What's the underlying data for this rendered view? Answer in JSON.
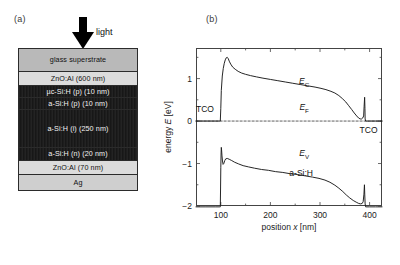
{
  "figure": {
    "panel_a_letter": "(a)",
    "panel_b_letter": "(b)"
  },
  "stack": {
    "light_label": "light",
    "layers": [
      {
        "label": "glass superstrate",
        "tone": "glass"
      },
      {
        "label": "ZnO:Al (600 nm)",
        "tone": "tco"
      },
      {
        "label": "µc-Si:H (p) (10 nm)",
        "tone": "dark"
      },
      {
        "label": "a-Si:H (p) (10 nm)",
        "tone": "dark"
      },
      {
        "label": "a-Si:H (i) (250 nm)",
        "tone": "dark"
      },
      {
        "label": "a-Si:H (n) (20 nm)",
        "tone": "dark"
      },
      {
        "label": "ZnO:Al (70 nm)",
        "tone": "tco"
      },
      {
        "label": "Ag",
        "tone": "ag"
      }
    ]
  },
  "chart_data": {
    "type": "line",
    "title": "",
    "xlabel": "position x [nm]",
    "ylabel": "energy E [eV]",
    "xlim": [
      50,
      425
    ],
    "ylim": [
      -2,
      1.72
    ],
    "xticks": [
      100,
      200,
      300,
      400
    ],
    "xtick_labels": [
      "100",
      "200",
      "300",
      "400"
    ],
    "yticks": [
      1,
      0,
      -1,
      -2
    ],
    "ytick_labels": [
      "1",
      "0",
      "−1",
      "−2"
    ],
    "xminor": [
      150,
      250,
      350
    ],
    "yminor": [
      1.5,
      0.5,
      -0.5,
      -1.5
    ],
    "grid": false,
    "legend": "none",
    "annotations": [
      {
        "text": "TCO",
        "x": 68,
        "y": 0.28,
        "name": "tco-left-label"
      },
      {
        "text": "TCO",
        "x": 398,
        "y": -0.22,
        "name": "tco-right-label"
      },
      {
        "text": "E_C",
        "x": 268,
        "y": 0.92,
        "name": "conduction-band-label"
      },
      {
        "text": "E_F",
        "x": 268,
        "y": 0.3,
        "name": "fermi-level-label"
      },
      {
        "text": "E_V",
        "x": 268,
        "y": -0.78,
        "name": "valence-band-label"
      },
      {
        "text": "a-Si:H",
        "x": 262,
        "y": -1.22,
        "name": "absorber-label"
      }
    ],
    "series": [
      {
        "name": "E_C",
        "label": "conduction band edge",
        "style": "solid",
        "points": [
          [
            50,
            0.0
          ],
          [
            70,
            0.0
          ],
          [
            88,
            0.0
          ],
          [
            96,
            0.0
          ],
          [
            99,
            0.0
          ],
          [
            100,
            0.3
          ],
          [
            101,
            0.72
          ],
          [
            103,
            1.06
          ],
          [
            105,
            1.24
          ],
          [
            107,
            1.36
          ],
          [
            109,
            1.44
          ],
          [
            111,
            1.49
          ],
          [
            113,
            1.5
          ],
          [
            115,
            1.47
          ],
          [
            117,
            1.41
          ],
          [
            120,
            1.34
          ],
          [
            124,
            1.27
          ],
          [
            129,
            1.22
          ],
          [
            135,
            1.17
          ],
          [
            142,
            1.13
          ],
          [
            150,
            1.1
          ],
          [
            160,
            1.07
          ],
          [
            172,
            1.04
          ],
          [
            185,
            1.01
          ],
          [
            200,
            0.98
          ],
          [
            215,
            0.95
          ],
          [
            230,
            0.92
          ],
          [
            245,
            0.89
          ],
          [
            260,
            0.86
          ],
          [
            275,
            0.83
          ],
          [
            290,
            0.8
          ],
          [
            302,
            0.77
          ],
          [
            312,
            0.74
          ],
          [
            322,
            0.7
          ],
          [
            330,
            0.66
          ],
          [
            338,
            0.6
          ],
          [
            345,
            0.53
          ],
          [
            352,
            0.45
          ],
          [
            358,
            0.36
          ],
          [
            364,
            0.27
          ],
          [
            369,
            0.19
          ],
          [
            374,
            0.12
          ],
          [
            378,
            0.07
          ],
          [
            381,
            0.05
          ],
          [
            384,
            0.05
          ],
          [
            386,
            0.07
          ],
          [
            388,
            0.12
          ],
          [
            389,
            0.35
          ],
          [
            390,
            0.56
          ],
          [
            390.6,
            0.3
          ],
          [
            391,
            0.05
          ],
          [
            392,
            0.0
          ],
          [
            400,
            0.0
          ],
          [
            412,
            0.0
          ],
          [
            425,
            0.0
          ]
        ]
      },
      {
        "name": "E_V",
        "label": "valence band edge",
        "style": "solid",
        "points": [
          [
            50,
            -2.02
          ],
          [
            70,
            -2.02
          ],
          [
            90,
            -2.02
          ],
          [
            98,
            -2.02
          ],
          [
            99,
            -2.02
          ],
          [
            99.5,
            -1.6
          ],
          [
            100,
            -1.1
          ],
          [
            100.6,
            -0.75
          ],
          [
            101,
            -0.62
          ],
          [
            101.6,
            -0.68
          ],
          [
            102.4,
            -0.82
          ],
          [
            103.4,
            -0.94
          ],
          [
            104.6,
            -1.02
          ],
          [
            106,
            -1.0
          ],
          [
            108,
            -0.93
          ],
          [
            110,
            -0.89
          ],
          [
            113,
            -0.88
          ],
          [
            117,
            -0.9
          ],
          [
            122,
            -0.93
          ],
          [
            128,
            -0.97
          ],
          [
            136,
            -1.01
          ],
          [
            145,
            -1.05
          ],
          [
            156,
            -1.08
          ],
          [
            168,
            -1.11
          ],
          [
            182,
            -1.14
          ],
          [
            196,
            -1.16
          ],
          [
            210,
            -1.19
          ],
          [
            225,
            -1.21
          ],
          [
            240,
            -1.24
          ],
          [
            255,
            -1.26
          ],
          [
            270,
            -1.29
          ],
          [
            285,
            -1.32
          ],
          [
            298,
            -1.35
          ],
          [
            310,
            -1.39
          ],
          [
            320,
            -1.44
          ],
          [
            330,
            -1.51
          ],
          [
            338,
            -1.58
          ],
          [
            346,
            -1.66
          ],
          [
            353,
            -1.74
          ],
          [
            360,
            -1.81
          ],
          [
            367,
            -1.87
          ],
          [
            373,
            -1.91
          ],
          [
            378,
            -1.94
          ],
          [
            382,
            -1.95
          ],
          [
            385,
            -1.94
          ],
          [
            387,
            -1.9
          ],
          [
            388.6,
            -1.72
          ],
          [
            389.6,
            -1.5
          ],
          [
            390.2,
            -1.72
          ],
          [
            391,
            -1.95
          ],
          [
            392,
            -2.02
          ],
          [
            400,
            -2.02
          ],
          [
            412,
            -2.02
          ],
          [
            425,
            -2.02
          ]
        ]
      },
      {
        "name": "E_F",
        "label": "Fermi level",
        "style": "dashed",
        "points": [
          [
            50,
            0
          ],
          [
            425,
            0
          ]
        ]
      }
    ]
  }
}
